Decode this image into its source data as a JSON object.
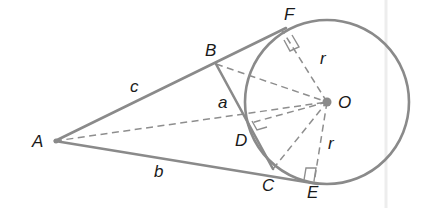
{
  "diagram": {
    "title": "",
    "points": {
      "A": {
        "label": "A",
        "x": 55,
        "y": 141
      },
      "B": {
        "label": "B",
        "x": 216,
        "y": 64
      },
      "C": {
        "label": "C",
        "x": 273,
        "y": 169
      },
      "D": {
        "label": "D",
        "x": 247,
        "y": 124
      },
      "E": {
        "label": "E",
        "x": 309,
        "y": 181
      },
      "F": {
        "label": "F",
        "x": 282,
        "y": 30
      },
      "O": {
        "label": "O",
        "x": 327,
        "y": 102
      }
    },
    "circle": {
      "center": "O",
      "radius": 82
    },
    "side_labels": {
      "c": "c",
      "b": "b",
      "a": "a",
      "r_upper": "r",
      "r_lower": "r"
    },
    "colors": {
      "line": "#8a8a8a",
      "text": "#1a1a1a",
      "background": "#ffffff"
    }
  }
}
